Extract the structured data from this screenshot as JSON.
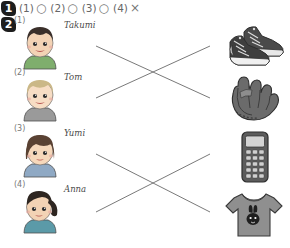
{
  "worksheet": {
    "question1": {
      "badge": "1",
      "answers": [
        {
          "num": "(1)",
          "mark": "○",
          "mark_name": "circle-correct"
        },
        {
          "num": "(2)",
          "mark": "○",
          "mark_name": "circle-correct"
        },
        {
          "num": "(3)",
          "mark": "○",
          "mark_name": "circle-correct"
        },
        {
          "num": "(4)",
          "mark": "×",
          "mark_name": "cross-incorrect"
        }
      ]
    },
    "question2": {
      "badge": "2",
      "people": [
        {
          "num": "(1)",
          "name": "Takumi",
          "hair": "#3a2f2a",
          "shirt": "#7fae6d",
          "skin": "#f3d3b5"
        },
        {
          "num": "(2)",
          "name": "Tom",
          "hair": "#cbb887",
          "shirt": "#9a9a9a",
          "skin": "#f7ddc4"
        },
        {
          "num": "(3)",
          "name": "Yumi",
          "hair": "#5a4233",
          "shirt": "#8fa9c4",
          "skin": "#f6d8bb"
        },
        {
          "num": "(4)",
          "name": "Anna",
          "hair": "#2e2621",
          "shirt": "#5b9aa8",
          "skin": "#f3d3b5"
        }
      ],
      "items": [
        {
          "label": "sneakers",
          "icon": "sneakers-icon"
        },
        {
          "label": "baseball glove",
          "icon": "baseball-glove-icon"
        },
        {
          "label": "mobile phone",
          "icon": "mobile-phone-icon"
        },
        {
          "label": "t-shirt",
          "icon": "tshirt-icon"
        }
      ],
      "connections": [
        {
          "from_person": 0,
          "to_item": 1
        },
        {
          "from_person": 1,
          "to_item": 0
        },
        {
          "from_person": 2,
          "to_item": 3
        },
        {
          "from_person": 3,
          "to_item": 2
        }
      ]
    },
    "colors": {
      "line": "#6a6a6a",
      "badge_bg": "#1d1d1d",
      "text": "#4a4a4a"
    }
  }
}
